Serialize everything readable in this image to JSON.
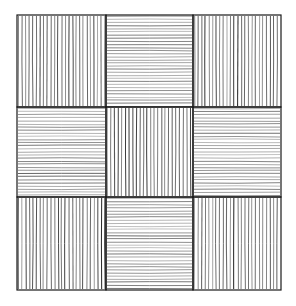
{
  "figure": {
    "grid": {
      "left": 17,
      "top": 15,
      "right": 281,
      "bottom": 290,
      "col_edges": [
        17,
        106,
        193,
        281
      ],
      "row_edges": [
        15,
        107,
        197,
        290
      ]
    },
    "cells": [
      [
        "vertical",
        "horizontal",
        "vertical"
      ],
      [
        "horizontal",
        "vertical",
        "horizontal"
      ],
      [
        "vertical",
        "horizontal",
        "vertical"
      ]
    ],
    "colors": {
      "background": "#ffffff",
      "ink": "#2a2a2a",
      "border": "#1a1a1a"
    },
    "hatch": {
      "vertical_spacing": 3.6,
      "horizontal_spacing": 3.1
    }
  }
}
